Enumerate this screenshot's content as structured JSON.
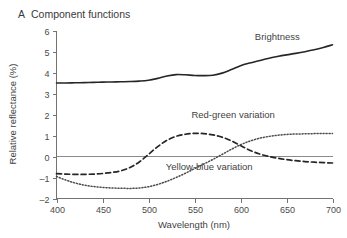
{
  "panel": {
    "letter": "A",
    "title": "Component functions"
  },
  "chart_data": {
    "type": "line",
    "title": "Component functions",
    "xlabel": "Wavelength (nm)",
    "ylabel": "Relative reflectance (%)",
    "xlim": [
      400,
      700
    ],
    "ylim": [
      -2,
      6
    ],
    "xticks": [
      400,
      450,
      500,
      550,
      600,
      650,
      700
    ],
    "yticks": [
      -2,
      -1,
      0,
      1,
      2,
      3,
      4,
      5,
      6
    ],
    "grid": false,
    "legend": "inline-annotations",
    "zero_line": 0,
    "x": [
      400,
      410,
      420,
      430,
      440,
      450,
      460,
      470,
      480,
      490,
      500,
      510,
      520,
      530,
      540,
      550,
      560,
      570,
      580,
      590,
      600,
      610,
      620,
      630,
      640,
      650,
      660,
      670,
      680,
      690,
      700
    ],
    "series": [
      {
        "name": "Brightness",
        "style": "solid",
        "values": [
          3.5,
          3.5,
          3.51,
          3.52,
          3.53,
          3.54,
          3.55,
          3.56,
          3.57,
          3.59,
          3.63,
          3.72,
          3.83,
          3.9,
          3.89,
          3.86,
          3.85,
          3.87,
          3.97,
          4.14,
          4.32,
          4.45,
          4.56,
          4.67,
          4.76,
          4.84,
          4.91,
          4.99,
          5.08,
          5.19,
          5.32
        ]
      },
      {
        "name": "Red-green variation",
        "style": "dashed",
        "values": [
          -0.82,
          -0.84,
          -0.85,
          -0.85,
          -0.84,
          -0.81,
          -0.76,
          -0.68,
          -0.52,
          -0.26,
          0.1,
          0.47,
          0.77,
          0.96,
          1.06,
          1.1,
          1.09,
          1.03,
          0.92,
          0.75,
          0.52,
          0.3,
          0.13,
          0.01,
          -0.08,
          -0.15,
          -0.2,
          -0.24,
          -0.27,
          -0.29,
          -0.31
        ]
      },
      {
        "name": "Yellow-blue variation",
        "style": "dotted",
        "values": [
          -0.95,
          -1.12,
          -1.26,
          -1.36,
          -1.43,
          -1.47,
          -1.5,
          -1.51,
          -1.52,
          -1.5,
          -1.44,
          -1.33,
          -1.18,
          -1.0,
          -0.8,
          -0.58,
          -0.36,
          -0.14,
          0.1,
          0.34,
          0.56,
          0.73,
          0.86,
          0.95,
          1.01,
          1.05,
          1.07,
          1.08,
          1.09,
          1.1,
          1.1
        ]
      }
    ],
    "annotations": [
      {
        "text": "Brightness",
        "x": 640,
        "y": 5.55
      },
      {
        "text": "Red-green variation",
        "x": 592,
        "y": 1.85
      },
      {
        "text": "Yellow-blue variation",
        "x": 566,
        "y": -0.62
      }
    ]
  },
  "colors": {
    "background": "#ffffff",
    "axis": "#737373",
    "solid_curve": "#262626",
    "dashed_curve": "#262626",
    "dotted_curve": "#4a4a4a",
    "text": "#3a3a3a"
  }
}
